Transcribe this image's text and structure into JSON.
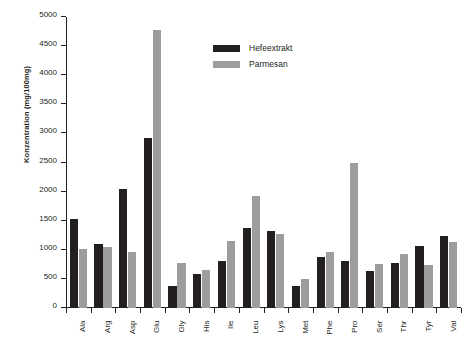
{
  "chart_data": {
    "type": "bar",
    "title": "",
    "xlabel": "",
    "ylabel": "Konzentration (mg/100mg)",
    "ylim": [
      0,
      5000
    ],
    "ytick_step": 500,
    "yticks": [
      0,
      500,
      1000,
      1500,
      2000,
      2500,
      3000,
      3500,
      4000,
      4500,
      5000
    ],
    "ytick_labels": [
      "0",
      "500",
      "1000",
      "1500",
      "2000",
      "2500",
      "3000",
      "3500",
      "4000",
      "4500",
      "5000"
    ],
    "grid": false,
    "legend_position": "upper-center",
    "categories": [
      "Ala",
      "Arg",
      "Asp",
      "Glu",
      "Gly",
      "His",
      "Ile",
      "Leu",
      "Lys",
      "Met",
      "Phe",
      "Pro",
      "Ser",
      "Thr",
      "Tyr",
      "Val"
    ],
    "series": [
      {
        "name": "Hefeextrakt",
        "color": "#231f20",
        "values": [
          1530,
          1100,
          2050,
          2920,
          380,
          590,
          810,
          1380,
          1320,
          380,
          870,
          800,
          640,
          770,
          1060,
          1240
        ]
      },
      {
        "name": "Parmesan",
        "color": "#9d9d9d",
        "values": [
          1010,
          1050,
          960,
          4780,
          770,
          660,
          1160,
          1930,
          1270,
          500,
          960,
          2500,
          760,
          930,
          740,
          1130
        ]
      }
    ]
  },
  "legend": {
    "entries": [
      {
        "label": "Hefeextrakt",
        "color": "#231f20"
      },
      {
        "label": "Parmesan",
        "color": "#9d9d9d"
      }
    ]
  },
  "axis": {
    "y_title": "Konzentration (mg/100mg)"
  }
}
